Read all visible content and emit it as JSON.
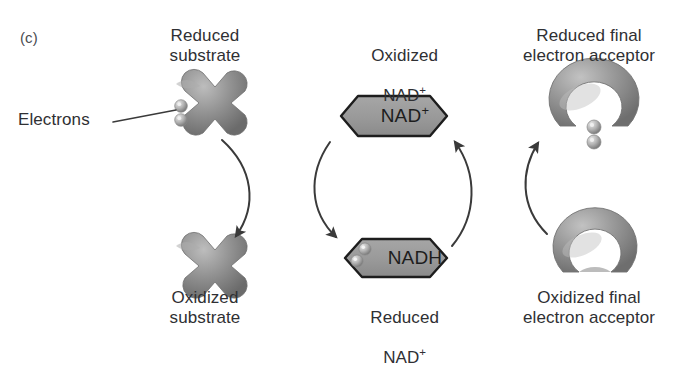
{
  "figure": {
    "panel_label": "(c)",
    "background_color": "#ffffff",
    "shape_fill": "#8e8e8e",
    "shape_outline": "#1d1d1d",
    "text_color": "#2f3033",
    "arrow_color": "#3a3a3a"
  },
  "labels": {
    "electrons": "Electrons",
    "reduced_substrate": "Reduced\nsubstrate",
    "oxidized_substrate": "Oxidized\nsubstrate",
    "oxidized_nad_line1": "Oxidized",
    "oxidized_nad_line2": "NAD",
    "oxidized_nad_sup": "+",
    "reduced_nad_line1": "Reduced",
    "reduced_nad_line2": "NAD",
    "reduced_nad_sup": "+",
    "reduced_acceptor": "Reduced final\nelectron acceptor",
    "oxidized_acceptor": "Oxidized final\nelectron acceptor"
  },
  "nodes": {
    "nad_plus": {
      "text": "NAD",
      "sup": "+",
      "shape": "hexagon",
      "electrons": 0
    },
    "nadh": {
      "text": "NADH",
      "sup": "",
      "shape": "hexagon",
      "electrons": 2
    },
    "reduced_substrate": {
      "shape": "cross",
      "electrons": 2
    },
    "oxidized_substrate": {
      "shape": "cross",
      "electrons": 0
    },
    "reduced_acceptor": {
      "shape": "horseshoe",
      "electrons": 2
    },
    "oxidized_acceptor": {
      "shape": "horseshoe",
      "electrons": 0
    }
  },
  "arrows": [
    {
      "name": "substrate-oxidation-arrow",
      "from": "reduced_substrate",
      "to": "oxidized_substrate"
    },
    {
      "name": "nad-reduction-arrow",
      "from": "nad_plus",
      "to": "nadh"
    },
    {
      "name": "nad-oxidation-arrow",
      "from": "nadh",
      "to": "nad_plus"
    },
    {
      "name": "acceptor-reduction-arrow",
      "from": "oxidized_acceptor",
      "to": "reduced_acceptor"
    }
  ]
}
